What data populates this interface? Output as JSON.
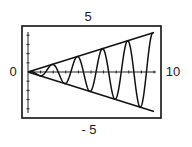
{
  "chart_data": {
    "type": "line",
    "title": "",
    "xlabel": "",
    "ylabel": "",
    "xlim": [
      0,
      10
    ],
    "ylim": [
      -5,
      5
    ],
    "grid": false,
    "legend": null,
    "window_labels": {
      "ymax": "5",
      "ymin": "- 5",
      "xmin": "0",
      "xmax": "10"
    },
    "x_ticks": 10,
    "y_ticks": 10,
    "series": [
      {
        "name": "upper envelope",
        "kind": "line",
        "x": [
          0,
          10
        ],
        "y": [
          0,
          4.3
        ]
      },
      {
        "name": "lower envelope",
        "kind": "line",
        "x": [
          0,
          10
        ],
        "y": [
          0,
          -4.3
        ]
      },
      {
        "name": "oscillating curve",
        "kind": "damped-growth oscillation bounded by envelopes",
        "peaks_x": [
          1.9,
          3.9,
          5.9,
          7.9,
          9.9
        ],
        "troughs_x": [
          0.9,
          2.9,
          4.9,
          6.9,
          8.9
        ],
        "amplitude_slope": 0.43
      }
    ],
    "colors": {
      "stroke": "#111111",
      "frame": "#111111",
      "label": "#222222"
    }
  }
}
